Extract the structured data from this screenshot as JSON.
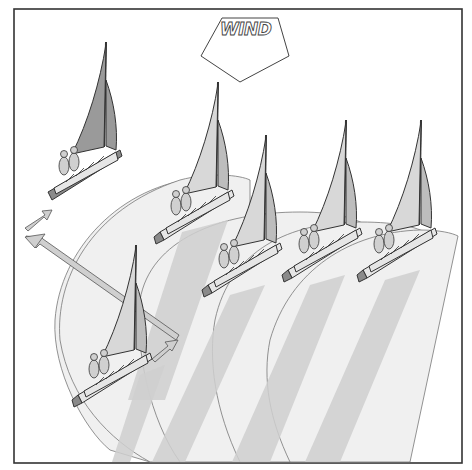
{
  "figure": {
    "title": "Wind shadow diagram",
    "wind_label": "WIND",
    "wind_direction": "down",
    "colors": {
      "background": "#ffffff",
      "frame": "#333333",
      "shadow_light": "#f0f0f0",
      "shadow_dark": "#cfcfcf",
      "sail": "#d8d8d8",
      "hull": "#e6e6e6"
    },
    "boats": [
      {
        "id": "boat-top-left",
        "position": "upper left, ahead and to windward",
        "sails_shade": "dark"
      },
      {
        "id": "boat-row-1",
        "position": "front row, first"
      },
      {
        "id": "boat-row-2",
        "position": "front row, second"
      },
      {
        "id": "boat-row-3",
        "position": "front row, third"
      },
      {
        "id": "boat-row-4",
        "position": "front row, fourth"
      },
      {
        "id": "boat-lower-left",
        "position": "lower left, tacking",
        "sails_shade": "mixed"
      }
    ],
    "arrows": [
      {
        "id": "course-arrow-long",
        "description": "long diagonal arrow from lower-left boat toward upper-left"
      },
      {
        "id": "course-arrow-upper",
        "description": "short arrow pointing up-right near upper-left boat"
      },
      {
        "id": "course-arrow-lower",
        "description": "short arrow pointing up-right near lower-left boat"
      }
    ]
  }
}
